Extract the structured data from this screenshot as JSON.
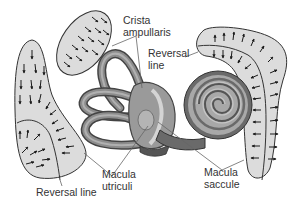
{
  "diagram": {
    "type": "anatomy",
    "colors": {
      "macula_fill": "#dcdcdc",
      "outline": "#333333",
      "arrow": "#1a1a1a",
      "canal_dark": "#5a5a5a",
      "canal_mid": "#8c8c8c",
      "canal_light": "#b8b8b8",
      "leader_line": "#666666"
    },
    "labels": {
      "crista": {
        "line1": "Crista",
        "line2": "ampullaris"
      },
      "reversal_right": {
        "line1": "Reversal",
        "line2": "line"
      },
      "reversal_left": {
        "text": "Reversal line"
      },
      "utriculi": {
        "line1": "Macula",
        "line2": "utriculi"
      },
      "saccule": {
        "line1": "Macula",
        "line2": "saccule"
      }
    }
  }
}
